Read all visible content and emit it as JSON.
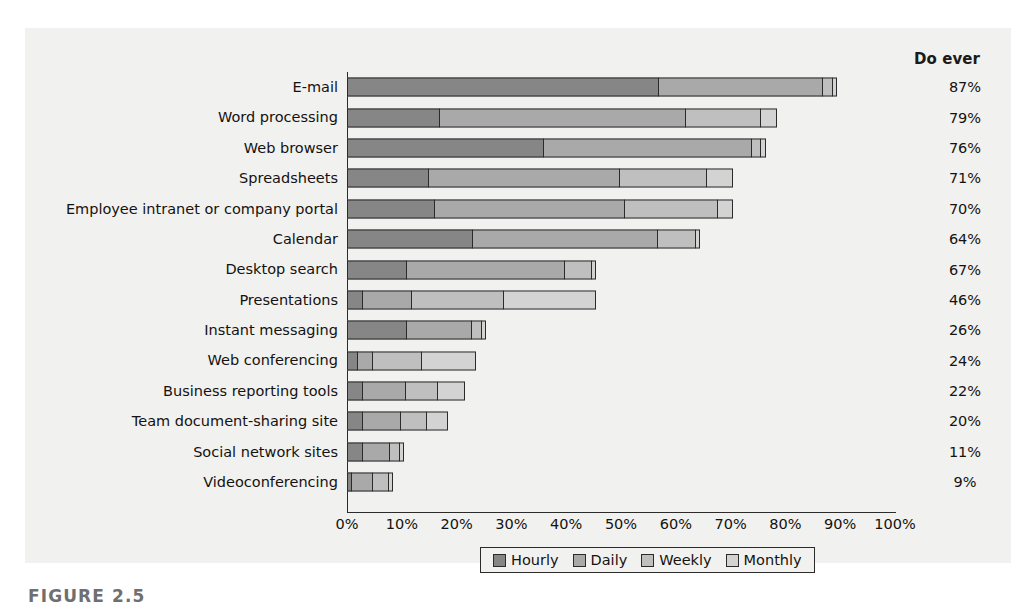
{
  "figure": {
    "caption": "FIGURE 2.5",
    "do_ever_header": "Do ever"
  },
  "legend": {
    "position": "bottom-center",
    "items": [
      {
        "label": "Hourly",
        "color": "#868686"
      },
      {
        "label": "Daily",
        "color": "#a9a9a9"
      },
      {
        "label": "Weekly",
        "color": "#bfbfbf"
      },
      {
        "label": "Monthly",
        "color": "#d3d3d3"
      }
    ]
  },
  "axis": {
    "ticks": [
      "0%",
      "10%",
      "20%",
      "30%",
      "40%",
      "50%",
      "60%",
      "70%",
      "80%",
      "90%",
      "100%"
    ]
  },
  "chart_data": {
    "type": "bar",
    "orientation": "horizontal",
    "stacked": true,
    "title": "",
    "xlabel": "",
    "ylabel": "",
    "xlim": [
      0,
      100
    ],
    "grid": false,
    "legend_position": "bottom-center",
    "categories": [
      "E-mail",
      "Word processing",
      "Web browser",
      "Spreadsheets",
      "Employee intranet or company portal",
      "Calendar",
      "Desktop search",
      "Presentations",
      "Instant messaging",
      "Web conferencing",
      "Business reporting tools",
      "Team document-sharing site",
      "Social network sites",
      "Videoconferencing"
    ],
    "series": [
      {
        "name": "Hourly",
        "values": [
          57,
          17,
          36,
          15,
          16,
          23,
          11,
          3,
          11,
          2,
          3,
          3,
          3,
          1
        ]
      },
      {
        "name": "Daily",
        "values": [
          30,
          45,
          38,
          35,
          35,
          34,
          29,
          9,
          12,
          3,
          8,
          7,
          5,
          4
        ]
      },
      {
        "name": "Weekly",
        "values": [
          2,
          14,
          2,
          16,
          17,
          7,
          5,
          17,
          2,
          9,
          6,
          5,
          2,
          3
        ]
      },
      {
        "name": "Monthly",
        "values": [
          1,
          3,
          1,
          5,
          3,
          1,
          1,
          17,
          1,
          10,
          5,
          4,
          1,
          1
        ]
      }
    ],
    "annotations": {
      "column_header": "Do ever",
      "do_ever": [
        "87%",
        "79%",
        "76%",
        "71%",
        "70%",
        "64%",
        "67%",
        "46%",
        "26%",
        "24%",
        "22%",
        "20%",
        "11%",
        "9%"
      ]
    }
  }
}
